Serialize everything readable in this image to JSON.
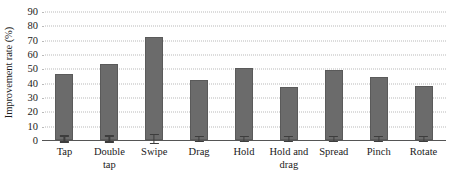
{
  "chart_data": {
    "type": "bar",
    "title": "",
    "xlabel": "",
    "ylabel": "Improvement rate (%)",
    "ylim": [
      0,
      90
    ],
    "yticks": [
      0,
      10,
      20,
      30,
      40,
      50,
      60,
      70,
      80,
      90
    ],
    "ytick_labels": [
      "0",
      "10",
      "20",
      "30",
      "40",
      "50",
      "60",
      "70",
      "80",
      "90"
    ],
    "grid": true,
    "grid_axis": "y",
    "grid_style": "dotted",
    "legend": null,
    "legend_position": "none",
    "categories": [
      "Tap",
      "Double\ntap",
      "Swipe",
      "Drag",
      "Hold",
      "Hold and\ndrag",
      "Spread",
      "Pinch",
      "Rotate"
    ],
    "values": [
      46,
      53,
      72,
      42,
      50,
      37,
      49,
      44,
      38
    ],
    "errors": [
      2.5,
      2.5,
      3.5,
      2.0,
      2.0,
      2.0,
      2.0,
      2.0,
      2.0
    ],
    "bar_color": "#6b6b6b",
    "error_color": "#3d3d3d",
    "grid_color": "#b9b9b9",
    "axis_color": "#555555",
    "background": "#ffffff"
  }
}
